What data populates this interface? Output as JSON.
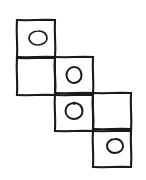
{
  "figure": {
    "background_color": "#ffffff",
    "stroke_color": "#1a1a1a",
    "canvas": {
      "width": 146,
      "height": 180
    },
    "grid": {
      "cell_size": 38,
      "columns_x": [
        17,
        55,
        93,
        131
      ],
      "rows_y": [
        20,
        57,
        93,
        129,
        165
      ],
      "description": "Three columns stepping down to the right; each column holds two stacked squares."
    },
    "squares": [
      {
        "id": "square-1",
        "column": 1,
        "row": 1,
        "x": 17,
        "y": 20,
        "size": 38,
        "oval": true,
        "oval_label": "oval-1"
      },
      {
        "id": "square-2",
        "column": 1,
        "row": 2,
        "x": 17,
        "y": 57,
        "size": 38,
        "oval": false,
        "oval_label": ""
      },
      {
        "id": "square-3",
        "column": 2,
        "row": 2,
        "x": 55,
        "y": 57,
        "size": 38,
        "oval": true,
        "oval_label": "oval-2"
      },
      {
        "id": "square-4",
        "column": 2,
        "row": 3,
        "x": 55,
        "y": 93,
        "size": 38,
        "oval": true,
        "oval_label": "oval-3"
      },
      {
        "id": "square-5",
        "column": 3,
        "row": 3,
        "x": 93,
        "y": 93,
        "size": 38,
        "oval": false,
        "oval_label": ""
      },
      {
        "id": "square-6",
        "column": 3,
        "row": 4,
        "x": 93,
        "y": 129,
        "size": 38,
        "oval": true,
        "oval_label": "oval-4"
      }
    ],
    "ovals": [
      {
        "id": "oval-1",
        "cx": 38,
        "cy": 38,
        "rx": 9,
        "ry": 7,
        "style": "irregular-pointed-right",
        "filled": false
      },
      {
        "id": "oval-2",
        "cx": 74,
        "cy": 75,
        "rx": 7.5,
        "ry": 8,
        "style": "round",
        "filled": false
      },
      {
        "id": "oval-3",
        "cx": 74,
        "cy": 111,
        "rx": 8.5,
        "ry": 8,
        "style": "round-with-top-notch",
        "filled": false
      },
      {
        "id": "oval-4",
        "cx": 115,
        "cy": 146,
        "rx": 8,
        "ry": 7,
        "style": "round",
        "filled": false
      }
    ],
    "counts": {
      "squares_total": 6,
      "squares_with_oval": 4,
      "squares_empty": 2
    }
  }
}
